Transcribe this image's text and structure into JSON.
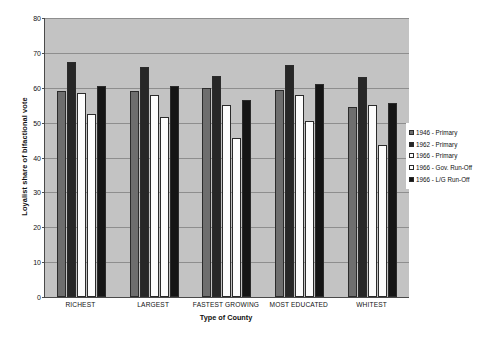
{
  "chart_data": {
    "type": "bar",
    "title": "",
    "xlabel": "Type of County",
    "ylabel": "Loyalist share of bifactional vote",
    "ylim": [
      0,
      80
    ],
    "ytick_step": 10,
    "yticks": [
      0,
      10,
      20,
      30,
      40,
      50,
      60,
      70,
      80
    ],
    "grid": true,
    "legend_position": "right",
    "plot_background": "#c3c3c3",
    "categories": [
      "RICHEST",
      "LARGEST",
      "FASTEST GROWING",
      "MOST EDUCATED",
      "WHITEST"
    ],
    "series": [
      {
        "name": "1946 - Primary",
        "color": "#6e6e6e",
        "values": [
          59,
          59,
          60,
          59.5,
          54.5
        ]
      },
      {
        "name": "1962 - Primary",
        "color": "#272727",
        "values": [
          67.5,
          66,
          63.5,
          66.5,
          63
        ]
      },
      {
        "name": "1966 - Primary",
        "color": "#fdfdfd",
        "values": [
          58.5,
          58,
          55,
          58,
          55
        ]
      },
      {
        "name": "1966 - Gov. Run-Off",
        "color": "#fdfdfd",
        "values": [
          52.5,
          51.5,
          45.5,
          50.5,
          43.5
        ]
      },
      {
        "name": "1966 - L/G Run-Off",
        "color": "#151515",
        "values": [
          60.5,
          60.5,
          56.5,
          61,
          55.5
        ]
      }
    ]
  },
  "caption": ""
}
